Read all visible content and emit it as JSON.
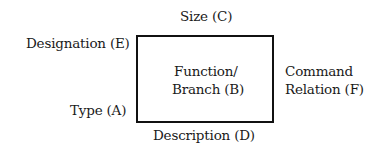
{
  "diagram": {
    "box": {
      "center_label_line1": "Function/",
      "center_label_line2": "Branch (B)",
      "border_color": "#111111"
    },
    "labels": {
      "top": "Size (C)",
      "top_left": "Designation (E)",
      "bottom_left": "Type (A)",
      "bottom": "Description (D)",
      "right_line1": "Command",
      "right_line2": "Relation (F)"
    }
  }
}
